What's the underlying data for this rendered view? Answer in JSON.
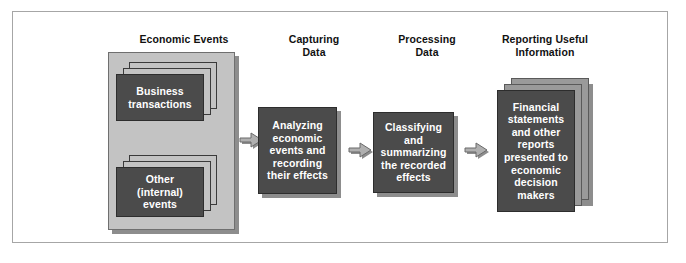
{
  "figure": {
    "colors": {
      "frame_border": "#a6a6a6",
      "panel_fill": "#c3c3c3",
      "panel_border": "#6f6f6f",
      "card_dark_fill": "#4b4b4b",
      "card_grey_fill": "#9a9a9a",
      "shadow": "#8d8d8d",
      "arrow_fill": "#a8a8a8",
      "arrow_border": "#6a6a6a",
      "text_on_dark": "#ffffff",
      "heading_text": "#111111"
    }
  },
  "headings": [
    {
      "id": "economic-events",
      "label": "Economic Events"
    },
    {
      "id": "capturing-data",
      "label": "Capturing\nData"
    },
    {
      "id": "processing-data",
      "label": "Processing\nData"
    },
    {
      "id": "reporting-useful",
      "label": "Reporting Useful\nInformation"
    }
  ],
  "stacks": {
    "business_transactions": {
      "label": "Business\ntransactions",
      "back_cards": 2
    },
    "other_internal_events": {
      "label": "Other\n(internal)\nevents",
      "back_cards": 2
    },
    "financial_statements": {
      "label": "Financial\nstatements\nand other\nreports\npresented to\neconomic\ndecision\nmakers",
      "back_cards": 2
    }
  },
  "process_boxes": [
    {
      "id": "capturing-box",
      "label": "Analyzing\neconomic\nevents and\nrecording\ntheir effects"
    },
    {
      "id": "processing-box",
      "label": "Classifying\nand\nsummarizing\nthe recorded\neffects"
    }
  ],
  "arrows": [
    {
      "id": "arrow-events-to-capturing",
      "direction": "right"
    },
    {
      "id": "arrow-capturing-to-processing",
      "direction": "right"
    },
    {
      "id": "arrow-processing-to-reporting",
      "direction": "right"
    }
  ]
}
